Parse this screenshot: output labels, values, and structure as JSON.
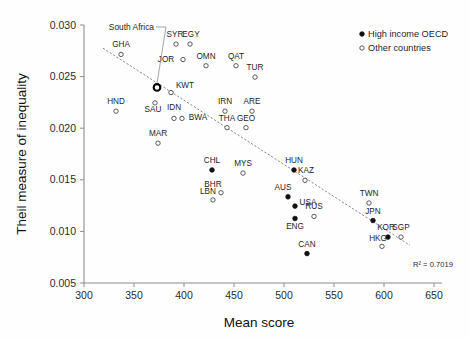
{
  "chart_data": {
    "type": "scatter",
    "title": "",
    "xlabel": "Mean score",
    "ylabel": "Theil measure of inequality",
    "xlim": [
      300,
      650
    ],
    "ylim": [
      0.005,
      0.03
    ],
    "xticks": [
      300,
      350,
      400,
      450,
      500,
      550,
      600,
      650
    ],
    "yticks": [
      "0.005",
      "0.010",
      "0.015",
      "0.020",
      "0.025",
      "0.030"
    ],
    "ytick_values": [
      0.005,
      0.01,
      0.015,
      0.02,
      0.025,
      0.03
    ],
    "grid": false,
    "legend_position": "top-right",
    "annotation_r2": "R² = 0.7019",
    "callout_label": "South Africa",
    "trendline": {
      "x_start": 319,
      "y_start": 0.02775,
      "x_end": 626,
      "y_end": 0.00865
    },
    "legend": [
      {
        "name": "High income OECD",
        "marker": "filled"
      },
      {
        "name": "Other countries",
        "marker": "open"
      }
    ],
    "series": [
      {
        "name": "High income OECD",
        "marker": "filled",
        "points": [
          {
            "label": "CHL",
            "x": 428,
            "y": 0.01595,
            "label_dx": 0,
            "label_dy": -7
          },
          {
            "label": "HUN",
            "x": 510,
            "y": 0.01595,
            "label_dx": 0,
            "label_dy": -7
          },
          {
            "label": "AUS",
            "x": 504,
            "y": 0.01335,
            "label_dx": -5,
            "label_dy": -7
          },
          {
            "label": "USA",
            "x": 511,
            "y": 0.01245,
            "label_dx": 13,
            "label_dy": -1
          },
          {
            "label": "ENG",
            "x": 511,
            "y": 0.01125,
            "label_dx": 0,
            "label_dy": 10
          },
          {
            "label": "CAN",
            "x": 523,
            "y": 0.00785,
            "label_dx": 0,
            "label_dy": -7
          },
          {
            "label": "JPN",
            "x": 589,
            "y": 0.01105,
            "label_dx": 0,
            "label_dy": -7
          },
          {
            "label": "KOR",
            "x": 604,
            "y": 0.00945,
            "label_dx": -2,
            "label_dy": -7
          }
        ]
      },
      {
        "name": "Other countries",
        "marker": "open",
        "points": [
          {
            "label": "GHA",
            "x": 337,
            "y": 0.02715,
            "label_dx": 0,
            "label_dy": -7
          },
          {
            "label": "SYR",
            "x": 392,
            "y": 0.02815,
            "label_dx": -1,
            "label_dy": -7
          },
          {
            "label": "EGY",
            "x": 406,
            "y": 0.02815,
            "label_dx": 1,
            "label_dy": -7
          },
          {
            "label": "JOR",
            "x": 399,
            "y": 0.02665,
            "label_dx": -17,
            "label_dy": 2
          },
          {
            "label": "OMN",
            "x": 422,
            "y": 0.02605,
            "label_dx": 0,
            "label_dy": -7
          },
          {
            "label": "QAT",
            "x": 452,
            "y": 0.02605,
            "label_dx": 0,
            "label_dy": -7
          },
          {
            "label": "TUR",
            "x": 471,
            "y": 0.02495,
            "label_dx": 0,
            "label_dy": -7
          },
          {
            "label": "KWT",
            "x": 387,
            "y": 0.02345,
            "label_dx": 14,
            "label_dy": -5
          },
          {
            "label": "HND",
            "x": 332,
            "y": 0.02165,
            "label_dx": 0,
            "label_dy": -7
          },
          {
            "label": "SAU",
            "x": 371,
            "y": 0.02245,
            "label_dx": -2,
            "label_dy": 9
          },
          {
            "label": "IDN",
            "x": 390,
            "y": 0.02095,
            "label_dx": 0,
            "label_dy": -8
          },
          {
            "label": "BWA",
            "x": 398,
            "y": 0.02095,
            "label_dx": 16,
            "label_dy": 2
          },
          {
            "label": "IRN",
            "x": 441,
            "y": 0.02165,
            "label_dx": 0,
            "label_dy": -7
          },
          {
            "label": "ARE",
            "x": 468,
            "y": 0.02165,
            "label_dx": 0,
            "label_dy": -7
          },
          {
            "label": "THA",
            "x": 443,
            "y": 0.02005,
            "label_dx": 0,
            "label_dy": -7
          },
          {
            "label": "GEO",
            "x": 462,
            "y": 0.02005,
            "label_dx": 0,
            "label_dy": -7
          },
          {
            "label": "MAR",
            "x": 374,
            "y": 0.01855,
            "label_dx": 0,
            "label_dy": -7
          },
          {
            "label": "MYS",
            "x": 459,
            "y": 0.01565,
            "label_dx": 0,
            "label_dy": -7
          },
          {
            "label": "KAZ",
            "x": 521,
            "y": 0.01495,
            "label_dx": 1,
            "label_dy": -7
          },
          {
            "label": "BHR",
            "x": 437,
            "y": 0.01375,
            "label_dx": -8,
            "label_dy": -6
          },
          {
            "label": "LBN",
            "x": 429,
            "y": 0.01305,
            "label_dx": -5,
            "label_dy": -6
          },
          {
            "label": "RUS",
            "x": 530,
            "y": 0.01145,
            "label_dx": 0,
            "label_dy": -7
          },
          {
            "label": "TWN",
            "x": 585,
            "y": 0.01275,
            "label_dx": 0,
            "label_dy": -7
          },
          {
            "label": "SGP",
            "x": 617,
            "y": 0.00945,
            "label_dx": 0,
            "label_dy": -7
          },
          {
            "label": "HKG",
            "x": 598,
            "y": 0.00855,
            "label_dx": -4,
            "label_dy": -5
          }
        ]
      },
      {
        "name": "Highlighted",
        "marker": "highlight",
        "points": [
          {
            "label": "",
            "x": 373,
            "y": 0.02395,
            "label_dx": 0,
            "label_dy": 0
          }
        ]
      }
    ]
  }
}
